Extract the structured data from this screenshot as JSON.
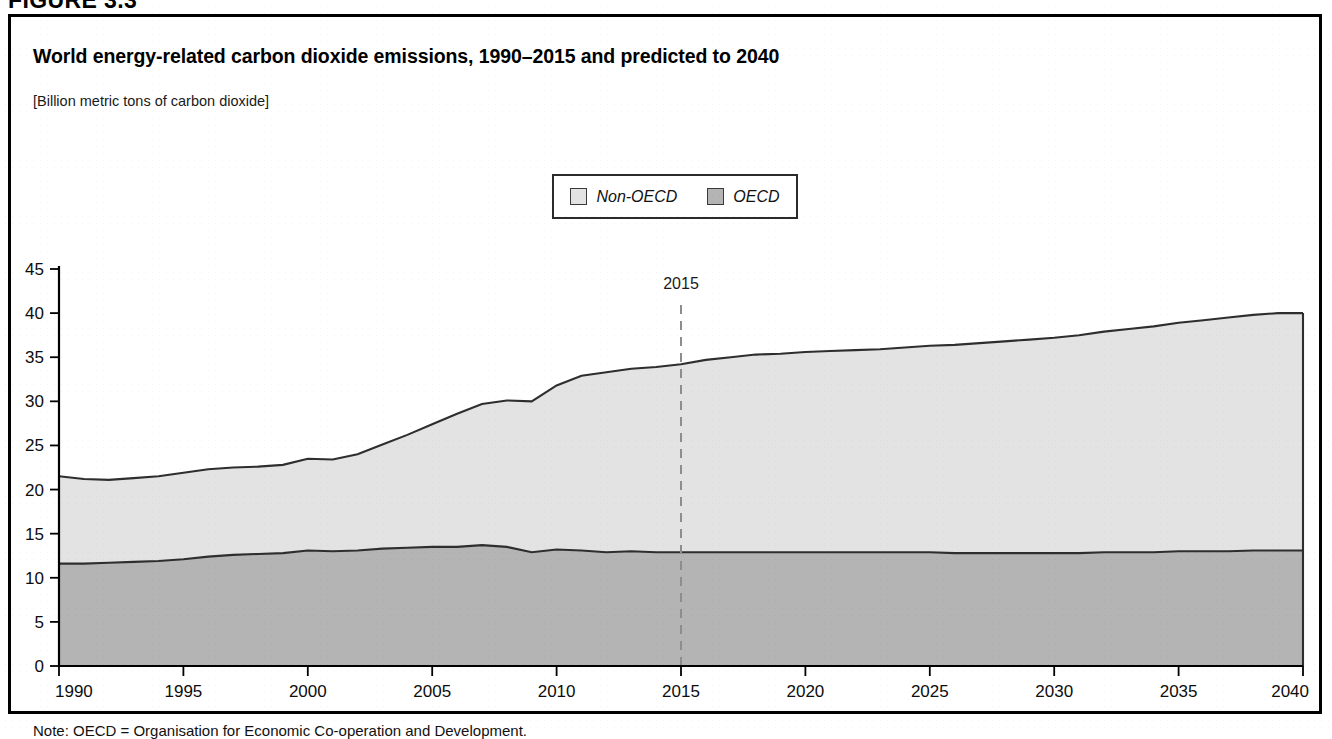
{
  "figure": {
    "number_label": "FIGURE 3.3",
    "title": "World energy-related carbon dioxide emissions, 1990–2015 and predicted to 2040",
    "units": "[Billion metric tons of carbon dioxide]",
    "note": "Note: OECD = Organisation for Economic Co-operation and Development."
  },
  "legend": {
    "position": "top-center",
    "entries": [
      {
        "label": "Non-OECD",
        "color": "#e3e3e3",
        "swatch_name": "legend-swatch-non-oecd"
      },
      {
        "label": "OECD",
        "color": "#b4b4b4",
        "swatch_name": "legend-swatch-oecd"
      }
    ]
  },
  "annotations": [
    {
      "label": "2015",
      "x": 2015,
      "type": "vertical-dashed-divider",
      "color": "#8d8d8d"
    }
  ],
  "colors": {
    "non_oecd_fill": "#e3e3e3",
    "oecd_fill": "#b4b4b4",
    "outline": "#2e2e2e",
    "axis": "#000000",
    "divider": "#8d8d8d"
  },
  "chart_data": {
    "type": "area",
    "stacked": true,
    "title": "World energy-related carbon dioxide emissions, 1990–2015 and predicted to 2040",
    "subtitle": "[Billion metric tons of carbon dioxide]",
    "xlabel": "",
    "ylabel": "",
    "units": "Billion metric tons of carbon dioxide",
    "grid": false,
    "legend_position": "top-center",
    "xlim": [
      1990,
      2040
    ],
    "ylim": [
      0,
      45
    ],
    "ytick_values": [
      0,
      5,
      10,
      15,
      20,
      25,
      30,
      35,
      40,
      45
    ],
    "ytick_labels": [
      "0",
      "5",
      "10",
      "15",
      "20",
      "25",
      "30",
      "35",
      "40",
      "45"
    ],
    "xtick_values": [
      1990,
      1995,
      2000,
      2005,
      2010,
      2015,
      2020,
      2025,
      2030,
      2035,
      2040
    ],
    "xtick_labels": [
      "1990",
      "1995",
      "2000",
      "2005",
      "2010",
      "2015",
      "2020",
      "2025",
      "2030",
      "2035",
      "2040"
    ],
    "x": [
      1990,
      1991,
      1992,
      1993,
      1994,
      1995,
      1996,
      1997,
      1998,
      1999,
      2000,
      2001,
      2002,
      2003,
      2004,
      2005,
      2006,
      2007,
      2008,
      2009,
      2010,
      2011,
      2012,
      2013,
      2014,
      2015,
      2016,
      2017,
      2018,
      2019,
      2020,
      2021,
      2022,
      2023,
      2024,
      2025,
      2026,
      2027,
      2028,
      2029,
      2030,
      2031,
      2032,
      2033,
      2034,
      2035,
      2036,
      2037,
      2038,
      2039,
      2040
    ],
    "series": [
      {
        "name": "OECD",
        "color": "#b4b4b4",
        "values": [
          11.6,
          11.6,
          11.7,
          11.8,
          11.9,
          12.1,
          12.4,
          12.6,
          12.7,
          12.8,
          13.1,
          13.0,
          13.1,
          13.3,
          13.4,
          13.5,
          13.5,
          13.7,
          13.5,
          12.9,
          13.2,
          13.1,
          12.9,
          13.0,
          12.9,
          12.9,
          12.9,
          12.9,
          12.9,
          12.9,
          12.9,
          12.9,
          12.9,
          12.9,
          12.9,
          12.9,
          12.8,
          12.8,
          12.8,
          12.8,
          12.8,
          12.8,
          12.9,
          12.9,
          12.9,
          13.0,
          13.0,
          13.0,
          13.1,
          13.1,
          13.1
        ]
      },
      {
        "name": "Non-OECD",
        "color": "#e3e3e3",
        "values": [
          9.9,
          9.6,
          9.4,
          9.5,
          9.6,
          9.8,
          9.9,
          9.9,
          9.9,
          10.0,
          10.4,
          10.4,
          10.9,
          11.8,
          12.8,
          13.9,
          15.1,
          16.0,
          16.6,
          17.1,
          18.6,
          19.8,
          20.4,
          20.7,
          21.0,
          21.3,
          21.8,
          22.1,
          22.4,
          22.5,
          22.7,
          22.8,
          22.9,
          23.0,
          23.2,
          23.4,
          23.6,
          23.8,
          24.0,
          24.2,
          24.4,
          24.7,
          25.0,
          25.3,
          25.6,
          25.9,
          26.2,
          26.5,
          26.7,
          26.9,
          26.9
        ]
      }
    ],
    "totals": [
      21.5,
      21.2,
      21.1,
      21.3,
      21.5,
      21.9,
      22.3,
      22.5,
      22.6,
      22.8,
      23.5,
      23.4,
      24.0,
      25.1,
      26.2,
      27.4,
      28.6,
      29.7,
      30.1,
      30.0,
      31.8,
      32.9,
      33.3,
      33.7,
      33.9,
      34.2,
      34.7,
      35.0,
      35.3,
      35.4,
      35.6,
      35.7,
      35.8,
      35.9,
      36.1,
      36.3,
      36.4,
      36.6,
      36.8,
      37.0,
      37.2,
      37.5,
      37.9,
      38.2,
      38.5,
      38.9,
      39.2,
      39.5,
      39.8,
      40.0,
      40.0
    ]
  }
}
